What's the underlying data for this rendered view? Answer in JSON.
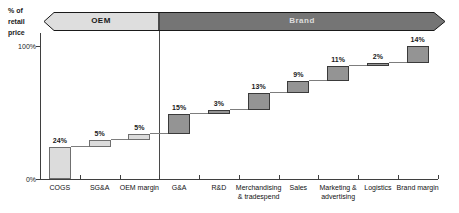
{
  "y_axis_label_lines": [
    "% of",
    "retail",
    "price"
  ],
  "banner": {
    "oem_label": "OEM",
    "brand_label": "Brand",
    "oem_fill": "#dedede",
    "brand_fill": "#757575",
    "border_color": "#1a1a1a",
    "oem_text_color": "#1a1a1a",
    "brand_text_color": "#dddddd"
  },
  "axis": {
    "y_ticks": [
      {
        "label": "100%",
        "value": 100
      },
      {
        "label": "0%",
        "value": 0
      }
    ]
  },
  "chart_data": {
    "type": "bar",
    "subtype": "waterfall",
    "title": "",
    "ylabel": "% of retail price",
    "ylim": [
      0,
      100
    ],
    "grid": false,
    "groups": [
      "OEM",
      "Brand"
    ],
    "steps": [
      {
        "category": "COGS",
        "category_lines": [
          "COGS"
        ],
        "label": "24%",
        "value": 24,
        "start": 0,
        "end": 24,
        "group": "OEM"
      },
      {
        "category": "SG&A",
        "category_lines": [
          "SG&A"
        ],
        "label": "5%",
        "value": 5,
        "start": 24,
        "end": 29,
        "group": "OEM"
      },
      {
        "category": "OEM margin",
        "category_lines": [
          "OEM margin"
        ],
        "label": "5%",
        "value": 5,
        "start": 29,
        "end": 34,
        "group": "OEM"
      },
      {
        "category": "G&A",
        "category_lines": [
          "G&A"
        ],
        "label": "15%",
        "value": 15,
        "start": 34,
        "end": 49,
        "group": "Brand"
      },
      {
        "category": "R&D",
        "category_lines": [
          "R&D"
        ],
        "label": "3%",
        "value": 3,
        "start": 49,
        "end": 52,
        "group": "Brand"
      },
      {
        "category": "Merchandising & tradespend",
        "category_lines": [
          "Merchandising",
          "& tradespend"
        ],
        "label": "13%",
        "value": 13,
        "start": 52,
        "end": 65,
        "group": "Brand"
      },
      {
        "category": "Sales",
        "category_lines": [
          "Sales"
        ],
        "label": "9%",
        "value": 9,
        "start": 65,
        "end": 74,
        "group": "Brand"
      },
      {
        "category": "Marketing & advertising",
        "category_lines": [
          "Marketing &",
          "advertising"
        ],
        "label": "11%",
        "value": 11,
        "start": 74,
        "end": 85,
        "group": "Brand"
      },
      {
        "category": "Logistics",
        "category_lines": [
          "Logistics"
        ],
        "label": "2%",
        "value": 2,
        "start": 85,
        "end": 87,
        "group": "Brand"
      },
      {
        "category": "Brand margin",
        "category_lines": [
          "Brand margin"
        ],
        "label": "14%",
        "value": 14,
        "start": 87,
        "end": 100,
        "group": "Brand"
      }
    ],
    "colors": {
      "oem_bar_fill": "#dcdcdc",
      "oem_bar_border": "#6f6f6f",
      "brand_bar_fill": "#949494",
      "brand_bar_border": "#3a3a3a",
      "connector": "#7d7d7d",
      "axis": "#3f3f3f"
    }
  }
}
